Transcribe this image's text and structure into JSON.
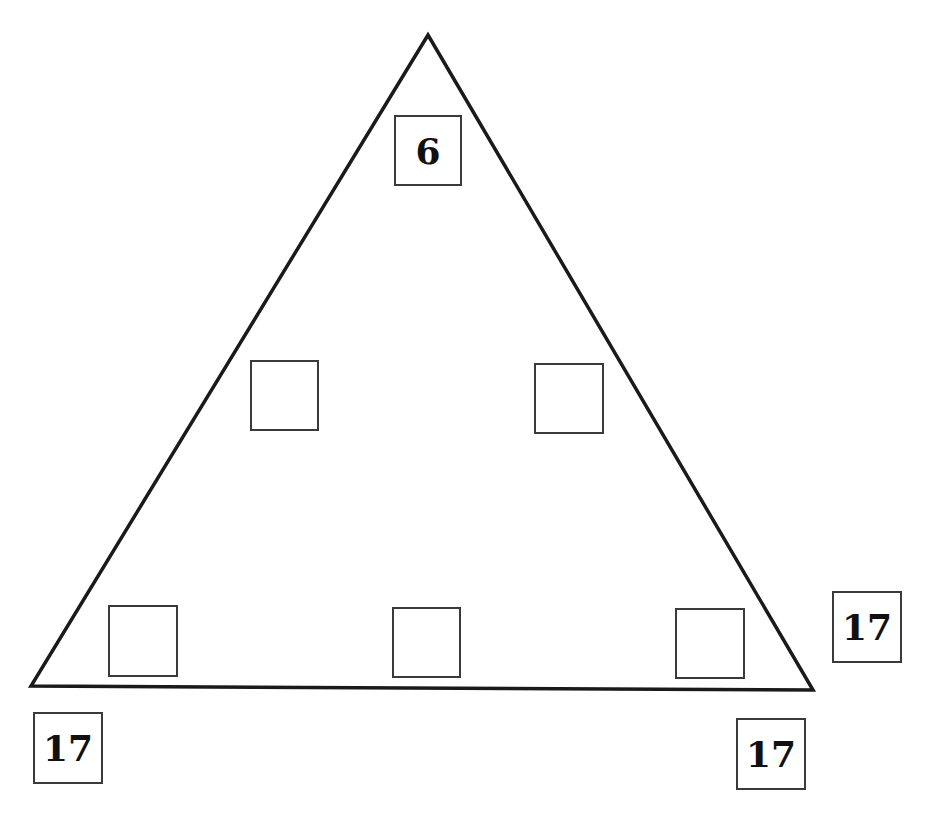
{
  "diagram": {
    "title": "",
    "shape": "triangle",
    "vertices": {
      "apex": [
        428,
        35
      ],
      "bottom_left": [
        31,
        686
      ],
      "bottom_right": [
        813,
        690
      ]
    },
    "boxes": [
      {
        "id": "apex-box",
        "value": "6",
        "x": 394,
        "y": 115,
        "w": 68,
        "h": 71
      },
      {
        "id": "left-mid-box",
        "value": "",
        "x": 250,
        "y": 360,
        "w": 69,
        "h": 71
      },
      {
        "id": "right-mid-box",
        "value": "",
        "x": 534,
        "y": 363,
        "w": 70,
        "h": 71
      },
      {
        "id": "bottom-left-inner-box",
        "value": "",
        "x": 108,
        "y": 605,
        "w": 70,
        "h": 72
      },
      {
        "id": "bottom-mid-box",
        "value": "",
        "x": 392,
        "y": 607,
        "w": 69,
        "h": 71
      },
      {
        "id": "bottom-right-inner-box",
        "value": "",
        "x": 675,
        "y": 608,
        "w": 70,
        "h": 71
      },
      {
        "id": "right-side-sum-box",
        "value": "17",
        "x": 832,
        "y": 591,
        "w": 70,
        "h": 72
      },
      {
        "id": "left-side-sum-box",
        "value": "17",
        "x": 33,
        "y": 712,
        "w": 70,
        "h": 72
      },
      {
        "id": "bottom-side-sum-box",
        "value": "17",
        "x": 736,
        "y": 718,
        "w": 70,
        "h": 72
      }
    ],
    "colors": {
      "line": "#1a1a1a",
      "box_border": "#3a3a3a",
      "text": "#111111"
    }
  }
}
